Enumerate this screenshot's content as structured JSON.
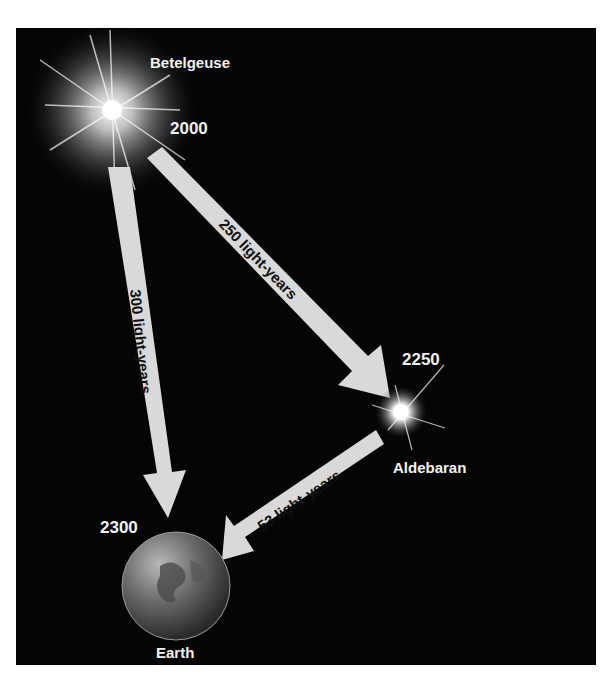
{
  "diagram": {
    "stars": [
      {
        "name": "Betelgeuse",
        "year": "2000"
      },
      {
        "name": "Aldebaran",
        "year": "2250"
      },
      {
        "name": "Earth",
        "year": "2300"
      }
    ],
    "arrows": [
      {
        "from": "Betelgeuse",
        "to": "Aldebaran",
        "label": "250 light-years"
      },
      {
        "from": "Betelgeuse",
        "to": "Earth",
        "label": "300 light-years"
      },
      {
        "from": "Aldebaran",
        "to": "Earth",
        "label": "53 light-years"
      }
    ],
    "colors": {
      "background": "#050505",
      "arrow": "#d9d9d9",
      "text": "#f2f2f2"
    }
  }
}
